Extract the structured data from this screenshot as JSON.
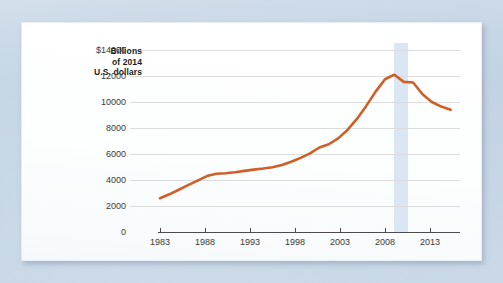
{
  "chart_data": {
    "type": "line",
    "title": "",
    "subtitle": "",
    "xlabel": "",
    "ylabel": "Billions of 2014 U.S. dollars",
    "ylabel_lines": [
      "Billions",
      "of 2014",
      "U.S. dollars"
    ],
    "y_ticklabels": [
      "$14000",
      "12000",
      "10000",
      "8000",
      "6000",
      "4000",
      "2000",
      "0"
    ],
    "y_tickvalues": [
      14000,
      12000,
      10000,
      8000,
      6000,
      4000,
      2000,
      0
    ],
    "x_ticklabels": [
      "1983",
      "1988",
      "1993",
      "1998",
      "2003",
      "2008",
      "2013"
    ],
    "x_tickvalues": [
      1983,
      1988,
      1993,
      1998,
      2003,
      2008,
      2013
    ],
    "ylim": [
      0,
      14000
    ],
    "xlim": [
      1983,
      2015
    ],
    "grid": "horizontal",
    "legend": "none",
    "line_color": "#cf5f26",
    "band_color": "#d3e2f2",
    "gridline_color": "#dcdcdc",
    "axis_color": "#4c4c4c",
    "annotations": [
      {
        "name": "recession-band",
        "x_start": 2008.0,
        "x_end": 2009.5,
        "label": ""
      }
    ],
    "x": [
      1983,
      1984,
      1985,
      1986,
      1987,
      1988,
      1989,
      1990,
      1991,
      1992,
      1993,
      1994,
      1995,
      1996,
      1997,
      1998,
      1999,
      2000,
      2001,
      2002,
      2003,
      2004,
      2005,
      2006,
      2007,
      2008,
      2009,
      2010,
      2011,
      2012,
      2013,
      2014
    ],
    "values": [
      2600,
      2900,
      3250,
      3600,
      3950,
      4300,
      4480,
      4520,
      4600,
      4700,
      4800,
      4880,
      4980,
      5150,
      5400,
      5700,
      6050,
      6500,
      6750,
      7200,
      7850,
      8700,
      9700,
      10800,
      11750,
      12100,
      11550,
      11500,
      10600,
      10000,
      9650,
      9400
    ],
    "series": [
      {
        "name": "Household debt",
        "color": "#cf5f26",
        "values": [
          2600,
          2900,
          3250,
          3600,
          3950,
          4300,
          4480,
          4520,
          4600,
          4700,
          4800,
          4880,
          4980,
          5150,
          5400,
          5700,
          6050,
          6500,
          6750,
          7200,
          7850,
          8700,
          9700,
          10800,
          11750,
          12100,
          11550,
          11500,
          10600,
          10000,
          9650,
          9400
        ]
      }
    ],
    "peak": {
      "x": 2007.6,
      "y": 12100
    },
    "start": {
      "x": 1983,
      "y": 2600
    },
    "end": {
      "x": 2014.4,
      "y": 9400
    }
  }
}
